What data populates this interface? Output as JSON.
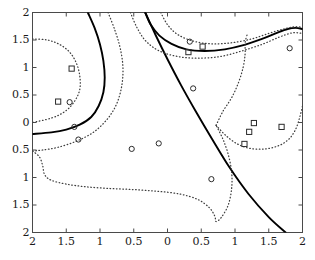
{
  "chart_data": {
    "type": "scatter",
    "title": "",
    "xlabel": "",
    "ylabel": "",
    "xlim": [
      -2,
      2
    ],
    "ylim": [
      -2,
      2
    ],
    "grid": false,
    "legend": null,
    "axis_inverted_y": true,
    "xticks": [
      -2,
      -1.5,
      -1,
      -0.5,
      0,
      0.5,
      1,
      1.5,
      2
    ],
    "xticklabels": [
      "2",
      "1.5",
      "1",
      "0.5",
      "0",
      "0.5",
      "1",
      "1.5",
      "2"
    ],
    "yticks": [
      2,
      1.5,
      1,
      0.5,
      0,
      -0.5,
      -1,
      -1.5,
      -2
    ],
    "yticklabels": [
      "2",
      "1.5",
      "1",
      "0.5",
      "0",
      "0.5",
      "1",
      "1.5",
      "2"
    ],
    "series": [
      {
        "name": "circles",
        "marker": "circle",
        "points": [
          [
            -1.45,
            0.37
          ],
          [
            -1.38,
            -0.08
          ],
          [
            -1.32,
            -0.31
          ],
          [
            -0.53,
            -0.48
          ],
          [
            -0.13,
            -0.38
          ],
          [
            0.33,
            1.47
          ],
          [
            0.38,
            0.62
          ],
          [
            0.65,
            -1.03
          ],
          [
            1.81,
            1.35
          ]
        ]
      },
      {
        "name": "squares",
        "marker": "square",
        "points": [
          [
            -1.42,
            0.98
          ],
          [
            -1.62,
            0.38
          ],
          [
            0.31,
            1.28
          ],
          [
            0.52,
            1.38
          ],
          [
            1.28,
            -0.01
          ],
          [
            1.21,
            -0.17
          ],
          [
            1.69,
            -0.08
          ],
          [
            1.14,
            -0.39
          ]
        ]
      }
    ],
    "curves": [
      {
        "name": "solid-boundary-left",
        "style": "solid",
        "points": [
          [
            -1.18,
            2.0
          ],
          [
            -1.08,
            1.72
          ],
          [
            -1.0,
            1.42
          ],
          [
            -0.95,
            1.12
          ],
          [
            -0.93,
            0.82
          ],
          [
            -0.95,
            0.55
          ],
          [
            -1.02,
            0.3
          ],
          [
            -1.13,
            0.1
          ],
          [
            -1.3,
            -0.04
          ],
          [
            -1.5,
            -0.13
          ],
          [
            -1.72,
            -0.18
          ],
          [
            -2.0,
            -0.21
          ]
        ]
      },
      {
        "name": "solid-boundary-right",
        "style": "solid",
        "points": [
          [
            -0.33,
            2.0
          ],
          [
            -0.25,
            1.78
          ],
          [
            -0.12,
            1.58
          ],
          [
            0.06,
            1.43
          ],
          [
            0.28,
            1.33
          ],
          [
            0.55,
            1.3
          ],
          [
            0.85,
            1.33
          ],
          [
            1.14,
            1.41
          ],
          [
            1.4,
            1.52
          ],
          [
            1.62,
            1.63
          ],
          [
            1.78,
            1.7
          ],
          [
            1.9,
            1.72
          ],
          [
            2.0,
            1.7
          ]
        ]
      },
      {
        "name": "solid-boundary-diagonal",
        "style": "solid",
        "points": [
          [
            -0.33,
            2.0
          ],
          [
            -0.18,
            1.6
          ],
          [
            0.0,
            1.15
          ],
          [
            0.2,
            0.68
          ],
          [
            0.42,
            0.2
          ],
          [
            0.66,
            -0.3
          ],
          [
            0.92,
            -0.82
          ],
          [
            1.2,
            -1.3
          ],
          [
            1.5,
            -1.72
          ],
          [
            1.75,
            -2.0
          ]
        ]
      },
      {
        "name": "dotted-inner-left",
        "style": "dotted",
        "points": [
          [
            -2.0,
            1.52
          ],
          [
            -1.78,
            1.5
          ],
          [
            -1.6,
            1.42
          ],
          [
            -1.45,
            1.28
          ],
          [
            -1.35,
            1.08
          ],
          [
            -1.3,
            0.85
          ],
          [
            -1.3,
            0.6
          ],
          [
            -1.38,
            0.38
          ],
          [
            -1.52,
            0.2
          ],
          [
            -1.72,
            0.08
          ],
          [
            -2.0,
            0.0
          ]
        ]
      },
      {
        "name": "dotted-outer-left",
        "style": "dotted",
        "points": [
          [
            -0.88,
            2.0
          ],
          [
            -0.78,
            1.68
          ],
          [
            -0.7,
            1.35
          ],
          [
            -0.66,
            1.0
          ],
          [
            -0.68,
            0.65
          ],
          [
            -0.76,
            0.32
          ],
          [
            -0.9,
            0.05
          ],
          [
            -1.1,
            -0.18
          ],
          [
            -1.35,
            -0.34
          ],
          [
            -1.62,
            -0.45
          ],
          [
            -1.85,
            -0.5
          ],
          [
            -2.0,
            -0.52
          ]
        ]
      },
      {
        "name": "dotted-lower-left-loop",
        "style": "dotted",
        "points": [
          [
            -2.0,
            -0.52
          ],
          [
            -1.9,
            -0.62
          ],
          [
            -1.85,
            -0.78
          ],
          [
            -1.82,
            -0.95
          ],
          [
            -1.72,
            -1.05
          ],
          [
            -1.5,
            -1.12
          ],
          [
            -1.2,
            -1.17
          ],
          [
            -0.85,
            -1.2
          ],
          [
            -0.5,
            -1.22
          ],
          [
            -0.15,
            -1.25
          ],
          [
            0.18,
            -1.3
          ],
          [
            0.45,
            -1.4
          ],
          [
            0.62,
            -1.55
          ],
          [
            0.7,
            -1.7
          ],
          [
            0.72,
            -1.8
          ],
          [
            0.8,
            -1.72
          ],
          [
            0.9,
            -1.5
          ],
          [
            0.95,
            -1.2
          ],
          [
            0.95,
            -0.9
          ],
          [
            0.9,
            -0.58
          ],
          [
            0.82,
            -0.3
          ],
          [
            0.72,
            -0.05
          ]
        ]
      },
      {
        "name": "dotted-inner-right",
        "style": "dotted",
        "points": [
          [
            -0.1,
            2.0
          ],
          [
            0.0,
            1.78
          ],
          [
            0.15,
            1.6
          ],
          [
            0.38,
            1.48
          ],
          [
            0.65,
            1.43
          ],
          [
            0.95,
            1.45
          ],
          [
            1.25,
            1.52
          ],
          [
            1.5,
            1.62
          ],
          [
            1.72,
            1.7
          ],
          [
            1.88,
            1.74
          ],
          [
            2.0,
            1.73
          ]
        ]
      },
      {
        "name": "dotted-outer-right",
        "style": "dotted",
        "points": [
          [
            -0.55,
            2.0
          ],
          [
            -0.45,
            1.72
          ],
          [
            -0.32,
            1.48
          ],
          [
            -0.12,
            1.3
          ],
          [
            0.15,
            1.2
          ],
          [
            0.45,
            1.17
          ],
          [
            0.78,
            1.2
          ],
          [
            1.1,
            1.3
          ],
          [
            1.4,
            1.42
          ],
          [
            1.65,
            1.55
          ],
          [
            1.85,
            1.63
          ],
          [
            2.0,
            1.62
          ]
        ]
      },
      {
        "name": "dotted-right-lower-branch",
        "style": "dotted",
        "points": [
          [
            0.72,
            -0.05
          ],
          [
            0.82,
            0.2
          ],
          [
            0.95,
            0.45
          ],
          [
            1.05,
            0.72
          ],
          [
            1.12,
            1.0
          ],
          [
            1.15,
            1.25
          ],
          [
            1.15,
            1.45
          ],
          [
            1.18,
            1.6
          ]
        ]
      },
      {
        "name": "dotted-right-cluster-loop",
        "style": "dotted",
        "points": [
          [
            0.72,
            -0.05
          ],
          [
            0.85,
            -0.22
          ],
          [
            1.02,
            -0.38
          ],
          [
            1.22,
            -0.47
          ],
          [
            1.45,
            -0.48
          ],
          [
            1.65,
            -0.42
          ],
          [
            1.8,
            -0.3
          ],
          [
            1.9,
            -0.12
          ],
          [
            1.96,
            0.1
          ],
          [
            2.0,
            0.3
          ]
        ]
      }
    ]
  }
}
